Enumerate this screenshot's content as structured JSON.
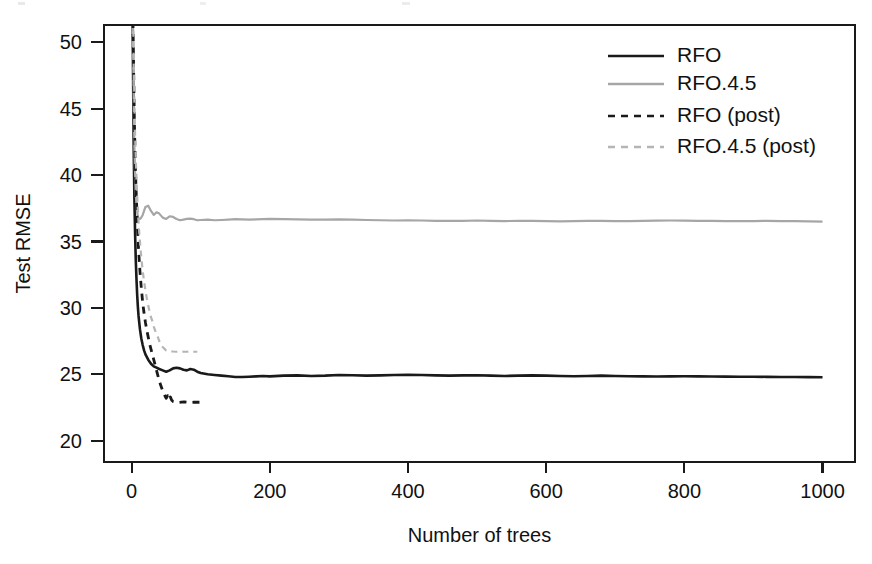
{
  "figure": {
    "background_color": "#ffffff",
    "plot_area": {
      "x0": 104,
      "y0": 25,
      "x1": 855,
      "y1": 462
    },
    "box_color": "#1a1a1a"
  },
  "chart_data": {
    "type": "line",
    "title": "",
    "xlabel": "Number of trees",
    "ylabel": "Test RMSE",
    "xlim": [
      -40,
      1047
    ],
    "ylim": [
      18.4,
      51.3
    ],
    "xticks": [
      0,
      200,
      400,
      600,
      800,
      1000
    ],
    "xtick_labels": [
      "0",
      "200",
      "400",
      "600",
      "800",
      "1000"
    ],
    "yticks": [
      20,
      25,
      30,
      35,
      40,
      45,
      50
    ],
    "ytick_labels": [
      "20",
      "25",
      "30",
      "35",
      "40",
      "45",
      "50"
    ],
    "grid": false,
    "legend_position": "top-right",
    "series": [
      {
        "name": "RFO",
        "color": "#1a1a1a",
        "style": "solid",
        "width": 2.6,
        "x": [
          1,
          2,
          3,
          4,
          5,
          6,
          7,
          8,
          9,
          10,
          12,
          14,
          16,
          18,
          20,
          24,
          28,
          32,
          36,
          40,
          45,
          50,
          55,
          60,
          65,
          70,
          75,
          80,
          85,
          90,
          95,
          100,
          110,
          120,
          130,
          140,
          150,
          160,
          170,
          180,
          190,
          200,
          220,
          240,
          260,
          280,
          300,
          320,
          340,
          360,
          380,
          400,
          420,
          440,
          460,
          480,
          500,
          520,
          540,
          560,
          580,
          600,
          620,
          640,
          660,
          680,
          700,
          720,
          740,
          760,
          780,
          800,
          820,
          840,
          860,
          880,
          900,
          920,
          940,
          960,
          980,
          1000
        ],
        "y": [
          56.0,
          48.0,
          42.0,
          38.2,
          35.6,
          33.6,
          32.2,
          31.0,
          30.1,
          29.4,
          28.4,
          27.7,
          27.2,
          26.8,
          26.5,
          26.1,
          25.8,
          25.6,
          25.5,
          25.4,
          25.3,
          25.2,
          25.3,
          25.45,
          25.5,
          25.45,
          25.35,
          25.3,
          25.4,
          25.35,
          25.2,
          25.1,
          25.0,
          24.95,
          24.9,
          24.85,
          24.8,
          24.8,
          24.82,
          24.85,
          24.88,
          24.85,
          24.9,
          24.92,
          24.88,
          24.9,
          24.95,
          24.93,
          24.9,
          24.92,
          24.95,
          24.97,
          24.95,
          24.92,
          24.9,
          24.92,
          24.93,
          24.9,
          24.88,
          24.9,
          24.92,
          24.9,
          24.88,
          24.86,
          24.88,
          24.9,
          24.88,
          24.86,
          24.85,
          24.84,
          24.85,
          24.86,
          24.85,
          24.84,
          24.83,
          24.82,
          24.82,
          24.81,
          24.8,
          24.8,
          24.79,
          24.78
        ]
      },
      {
        "name": "RFO.4.5",
        "color": "#a6a6a6",
        "style": "solid",
        "width": 2.2,
        "x": [
          1,
          2,
          3,
          4,
          5,
          6,
          7,
          8,
          9,
          10,
          12,
          14,
          16,
          18,
          20,
          24,
          28,
          32,
          36,
          40,
          45,
          50,
          55,
          60,
          65,
          70,
          75,
          80,
          85,
          90,
          95,
          100,
          110,
          120,
          130,
          140,
          150,
          160,
          170,
          180,
          190,
          200,
          220,
          240,
          260,
          280,
          300,
          320,
          340,
          360,
          380,
          400,
          420,
          440,
          460,
          480,
          500,
          520,
          540,
          560,
          580,
          600,
          620,
          640,
          660,
          680,
          700,
          720,
          740,
          760,
          780,
          800,
          820,
          840,
          860,
          880,
          900,
          920,
          940,
          960,
          980,
          1000
        ],
        "y": [
          57.0,
          50.5,
          45.5,
          42.0,
          40.0,
          38.6,
          37.8,
          37.2,
          36.9,
          36.7,
          36.7,
          36.8,
          37.0,
          37.3,
          37.6,
          37.7,
          37.3,
          37.0,
          37.2,
          37.1,
          36.8,
          36.7,
          36.9,
          36.85,
          36.7,
          36.6,
          36.65,
          36.7,
          36.72,
          36.68,
          36.6,
          36.62,
          36.65,
          36.6,
          36.62,
          36.65,
          36.68,
          36.66,
          36.64,
          36.66,
          36.68,
          36.7,
          36.68,
          36.66,
          36.64,
          36.65,
          36.66,
          36.64,
          36.62,
          36.6,
          36.58,
          36.6,
          36.58,
          36.56,
          36.55,
          36.56,
          36.58,
          36.56,
          36.54,
          36.55,
          36.56,
          36.54,
          36.52,
          36.54,
          36.56,
          36.55,
          36.54,
          36.53,
          36.55,
          36.57,
          36.58,
          36.57,
          36.56,
          36.55,
          36.54,
          36.53,
          36.54,
          36.55,
          36.54,
          36.53,
          36.52,
          36.5
        ]
      },
      {
        "name": "RFO (post)",
        "color": "#1a1a1a",
        "style": "dashed",
        "width": 2.8,
        "dash": "7,6",
        "x": [
          1,
          2,
          3,
          4,
          5,
          6,
          8,
          10,
          12,
          14,
          16,
          18,
          20,
          22,
          24,
          26,
          28,
          30,
          32,
          34,
          36,
          38,
          40,
          42,
          44,
          46,
          48,
          50,
          52,
          54,
          56,
          58,
          60,
          64,
          68,
          72,
          76,
          80,
          85,
          90,
          95,
          100
        ],
        "y": [
          56.5,
          51.0,
          47.5,
          44.0,
          41.5,
          39.6,
          36.6,
          34.4,
          32.8,
          31.5,
          30.4,
          29.6,
          28.9,
          28.3,
          27.8,
          27.3,
          26.9,
          26.5,
          26.1,
          25.7,
          25.3,
          24.9,
          24.5,
          24.2,
          23.9,
          23.6,
          23.4,
          23.2,
          23.4,
          23.1,
          23.3,
          23.05,
          22.95,
          22.9,
          22.88,
          22.9,
          22.92,
          22.9,
          22.88,
          22.9,
          22.9,
          22.9
        ]
      },
      {
        "name": "RFO.4.5 (post)",
        "color": "#b5b5b5",
        "style": "dashed",
        "width": 2.2,
        "dash": "6,5",
        "x": [
          1,
          2,
          3,
          4,
          5,
          6,
          8,
          10,
          12,
          14,
          16,
          18,
          20,
          22,
          24,
          26,
          28,
          30,
          32,
          34,
          36,
          38,
          40,
          42,
          44,
          46,
          48,
          50,
          55,
          60,
          65,
          70,
          75,
          80,
          85,
          90,
          95
        ],
        "y": [
          57.5,
          52.5,
          48.5,
          45.5,
          43.0,
          41.2,
          38.4,
          36.4,
          35.0,
          33.8,
          32.8,
          32.0,
          31.3,
          30.7,
          30.2,
          29.7,
          29.3,
          29.0,
          28.6,
          28.3,
          28.0,
          27.8,
          27.5,
          27.3,
          27.1,
          27.0,
          26.9,
          26.8,
          26.75,
          26.72,
          26.7,
          26.72,
          26.7,
          26.7,
          26.72,
          26.7,
          26.7
        ]
      }
    ]
  },
  "legend": {
    "entries": [
      {
        "label": "RFO",
        "color": "#1a1a1a",
        "style": "solid"
      },
      {
        "label": "RFO.4.5",
        "color": "#a6a6a6",
        "style": "solid"
      },
      {
        "label": "RFO (post)",
        "color": "#1a1a1a",
        "style": "dashed"
      },
      {
        "label": "RFO.4.5 (post)",
        "color": "#b5b5b5",
        "style": "dashed"
      }
    ]
  }
}
